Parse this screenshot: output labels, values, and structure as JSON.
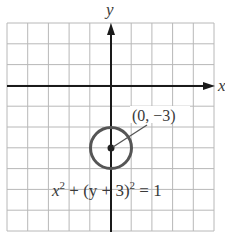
{
  "figure": {
    "axis_labels": {
      "x": "x",
      "y": "y"
    },
    "point_label": "(0, −3)",
    "equation": {
      "base1": "x",
      "exp1": "2",
      "mid": " + (y + 3)",
      "exp2": "2",
      "tail": " = 1"
    },
    "colors": {
      "grid": "#b8b8b8",
      "axis": "#1a1a1a",
      "circle": "#555555",
      "text": "#3a3a3a"
    }
  },
  "chart_data": {
    "type": "diagram",
    "title": "",
    "xlim": [
      -5,
      5
    ],
    "ylim": [
      -7,
      3
    ],
    "grid": true,
    "grid_step": 1,
    "circle": {
      "center": [
        0,
        -3
      ],
      "radius": 1
    },
    "annotations": [
      {
        "text": "(0, −3)",
        "points_to": [
          0,
          -3
        ]
      },
      {
        "text": "x^2 + (y + 3)^2 = 1"
      }
    ],
    "xlabel": "x",
    "ylabel": "y"
  }
}
